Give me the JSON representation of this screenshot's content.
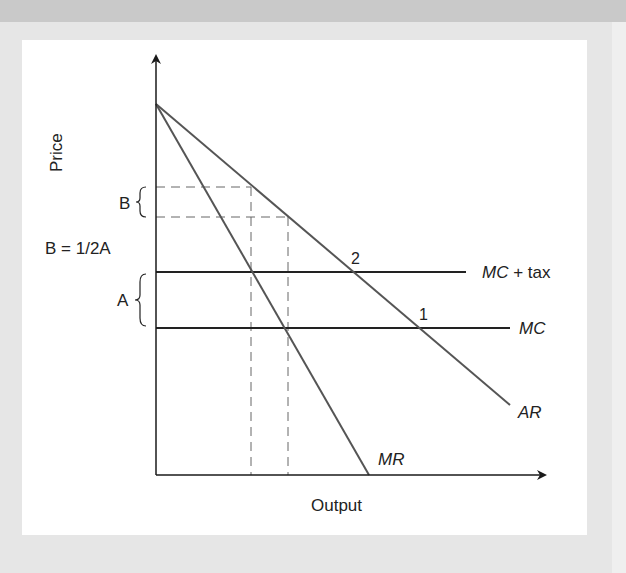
{
  "diagram": {
    "axes": {
      "y_label": "Price",
      "x_label": "Output"
    },
    "curves": {
      "ar_label": "AR",
      "mr_label": "MR",
      "mc_label": "MC",
      "mc_tax_label_italic": "MC",
      "mc_tax_label_rest": " + tax"
    },
    "points": {
      "point_1": "1",
      "point_2": "2"
    },
    "braces": {
      "b_label": "B",
      "a_label": "A",
      "relation": "B = 1/2A"
    },
    "colors": {
      "background": "#e6e6e6",
      "panel": "#ffffff",
      "axis": "#1a1a1a",
      "curve": "#555555",
      "cost_line": "#222222",
      "dashed": "#666666"
    }
  }
}
